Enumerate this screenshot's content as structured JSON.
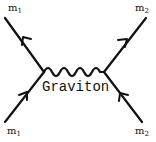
{
  "diagram": {
    "type": "feynman",
    "particles": {
      "top_left": {
        "symbol": "m",
        "sub": "1"
      },
      "bottom_left": {
        "symbol": "m",
        "sub": "1"
      },
      "top_right": {
        "symbol": "m",
        "sub": "2"
      },
      "bottom_right": {
        "symbol": "m",
        "sub": "2"
      }
    },
    "propagator_label": "Graviton",
    "line_color": "#111111"
  }
}
